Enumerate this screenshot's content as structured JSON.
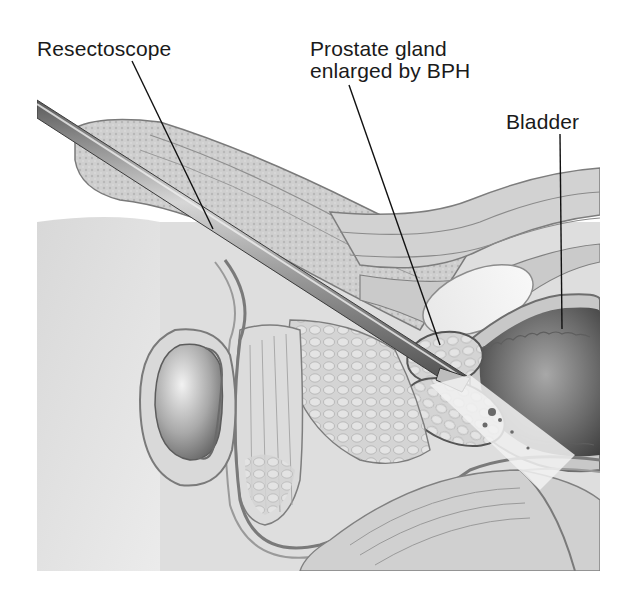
{
  "figure": {
    "style": "grayscale anatomical pencil illustration",
    "labels": [
      {
        "id": "resectoscope",
        "text": "Resectoscope"
      },
      {
        "id": "prostate",
        "line1": "Prostate gland",
        "line2": "enlarged by BPH"
      },
      {
        "id": "bladder",
        "text": "Bladder"
      }
    ],
    "colors": {
      "background": "#ffffff",
      "label_text": "#1a1a1a",
      "leader_line": "#111111",
      "tissue_light": "#e6e6e6",
      "tissue_mid": "#c4c4c4",
      "tissue_dark": "#8a8a8a",
      "bladder_cavity": "#6e6e6e",
      "scope_metal": "#9a9a9a"
    }
  }
}
